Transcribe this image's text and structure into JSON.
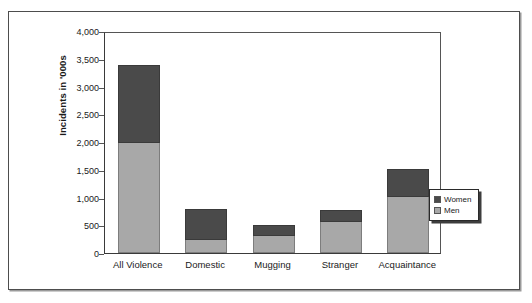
{
  "chart_data": {
    "type": "bar",
    "subtype": "stacked-bar",
    "title": "",
    "xlabel": "",
    "ylabel": "Incidents in '000s",
    "categories": [
      "All Violence",
      "Domestic",
      "Mugging",
      "Stranger",
      "Acquaintance"
    ],
    "series": [
      {
        "name": "Men",
        "color": "#a8a8a8",
        "values": [
          2000,
          255,
          330,
          570,
          1030
        ]
      },
      {
        "name": "Women",
        "color": "#4a4a4a",
        "values": [
          1400,
          555,
          185,
          215,
          500
        ]
      }
    ],
    "totals": [
      3400,
      810,
      515,
      785,
      1530
    ],
    "ylim": [
      0,
      4000
    ],
    "y_ticks": [
      0,
      500,
      1000,
      1500,
      2000,
      2500,
      3000,
      3500,
      4000
    ],
    "y_tick_labels": [
      "0",
      "500",
      "1,000",
      "1,500",
      "2,000",
      "2,500",
      "3,000",
      "3,500",
      "4,000"
    ],
    "grid": false,
    "legend_position": "right-bottom-outside",
    "legend_entries": [
      "Women",
      "Men"
    ]
  },
  "axis": {
    "y_title": "Incidents in '000s"
  },
  "legend": {
    "items": [
      {
        "label": "Women",
        "color": "#4a4a4a"
      },
      {
        "label": "Men",
        "color": "#a8a8a8"
      }
    ]
  },
  "colors": {
    "men": "#a8a8a8",
    "women": "#4a4a4a",
    "axis": "#3a3a3a",
    "frame": "#4d4d4d",
    "text": "#1a1a1a"
  }
}
